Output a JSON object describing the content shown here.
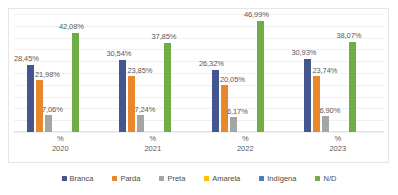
{
  "chart_data": {
    "type": "bar",
    "title": "",
    "subtitle": "",
    "xlabel": "",
    "ylabel": "",
    "ylim": [
      0,
      50
    ],
    "grid": true,
    "gridlines": [
      0,
      5,
      10,
      15,
      20,
      25,
      30,
      35,
      40,
      45,
      50
    ],
    "legend_position": "bottom",
    "categories": [
      "2020",
      "2021",
      "2022",
      "2023"
    ],
    "category_axis_prefix": "%",
    "value_suffix": "%",
    "decimal_separator": ",",
    "series": [
      {
        "name": "Branca",
        "color": "#44568f",
        "values": [
          28.45,
          30.54,
          26.32,
          30.93
        ],
        "labels": [
          "28,45%",
          "30,54%",
          "26,32%",
          "30,93%"
        ]
      },
      {
        "name": "Parda",
        "color": "#e8872b",
        "values": [
          21.98,
          23.85,
          20.05,
          23.74
        ],
        "labels": [
          "21,98%",
          "23,85%",
          "20,05%",
          "23,74%"
        ]
      },
      {
        "name": "Preta",
        "color": "#a5a5a5",
        "values": [
          7.06,
          7.24,
          6.17,
          6.9
        ],
        "labels": [
          "7,06%",
          "7,24%",
          "6,17%",
          "6,90%"
        ]
      },
      {
        "name": "Amarela",
        "color": "#ffc000",
        "values": [
          0,
          0,
          0,
          0
        ],
        "labels": [
          "",
          "",
          "",
          ""
        ]
      },
      {
        "name": "Indígena",
        "color": "#4a7ebb",
        "values": [
          0,
          0,
          0,
          0
        ],
        "labels": [
          "",
          "",
          "",
          ""
        ]
      },
      {
        "name": "N/D",
        "color": "#70ad47",
        "values": [
          42.08,
          37.85,
          46.99,
          38.07
        ],
        "labels": [
          "42,08%",
          "37,85%",
          "46,99%",
          "38,07%"
        ]
      }
    ]
  },
  "legend": {
    "items": [
      {
        "label": "Branca",
        "color": "#44568f"
      },
      {
        "label": "Parda",
        "color": "#e8872b"
      },
      {
        "label": "Preta",
        "color": "#a5a5a5"
      },
      {
        "label": "Amarela",
        "color": "#ffc000"
      },
      {
        "label": "Indígena",
        "color": "#4a7ebb"
      },
      {
        "label": "N/D",
        "color": "#70ad47"
      }
    ]
  },
  "xaxis": {
    "ticks": [
      {
        "pct": "%",
        "year": "2020"
      },
      {
        "pct": "%",
        "year": "2021"
      },
      {
        "pct": "%",
        "year": "2022"
      },
      {
        "pct": "%",
        "year": "2023"
      }
    ]
  }
}
